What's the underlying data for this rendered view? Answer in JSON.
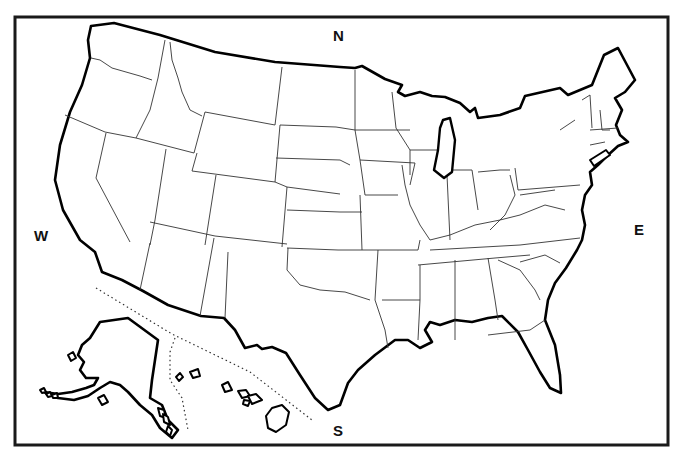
{
  "colors": {
    "background": "#ffffff",
    "coast": "#000000",
    "border": "#333333",
    "frame": "#1a1a1a"
  },
  "frame": {
    "x": 15,
    "y": 17,
    "width": 653,
    "height": 428
  },
  "compass": {
    "north": {
      "label": "N",
      "x": 333,
      "y": 28
    },
    "south": {
      "label": "S",
      "x": 333,
      "y": 423
    },
    "east": {
      "label": "E",
      "x": 634,
      "y": 222
    },
    "west": {
      "label": "W",
      "x": 34,
      "y": 228
    }
  },
  "regions": {
    "contiguous_us": "M91,26 L114,23 L160,35 L215,52 L275,62 L340,67 L355,68 L362,66 L385,79 L402,85 L398,92 L405,96 L420,92 L432,96 L445,97 L460,103 L470,112 L475,108 L478,118 L500,115 L520,108 L525,96 L560,88 L568,95 L592,85 L604,55 L618,48 L635,80 L625,92 L615,98 L622,110 L616,125 L620,135 L628,142 L618,146 L607,156 L598,165 L590,172 L592,185 L585,195 L582,210 L585,225 L582,240 L577,250 L566,268 L555,283 L548,300 L545,320 L555,345 L560,375 L561,393 L550,388 L540,372 L528,350 L518,332 L502,316 L488,318 L472,322 L455,320 L440,325 L430,322 L425,330 L432,342 L420,348 L408,340 L395,340 L375,355 L358,370 L348,383 L340,405 L328,410 L315,398 L300,375 L286,353 L272,347 L262,349 L257,345 L245,348 L235,330 L224,318 L201,316 L168,305 L143,291 L122,280 L102,272 L95,252 L80,240 L63,210 L55,180 L60,145 L70,112 L82,85 L90,58 L88,40 Z",
    "lake_michigan": "M443,120 L450,118 L455,140 L452,172 L444,178 L434,170 L438,150 L440,128 Z",
    "lake_michigan_north": "M420,115 L432,98 L445,100 L460,105 L470,112 L455,115 L440,112 L428,122 Z",
    "delaware_bay": "M580,185 L586,190 L584,200 L578,196 Z",
    "long_island": "M590,160 L606,150 L610,155 L594,166 Z",
    "alaska": "M100,322 L128,318 L158,340 L152,380 L150,398 L162,405 L168,420 L178,430 L172,438 L160,428 L152,415 L140,405 L128,392 L120,385 L110,382 L100,388 L88,396 L74,400 L58,398 L48,394 L44,392 L58,394 L72,392 L86,388 L94,385 L98,378 L86,378 L80,370 L84,362 L78,355 L82,345 L90,338 L95,330 Z",
    "hawaii_big": "M272,408 L282,405 L289,412 L286,425 L276,432 L268,428 L266,416 Z",
    "hawaii_islands": [
      "M176,377 L180,373 L183,377 L179,381 Z",
      "M190,372 L198,369 L200,376 L193,378 Z",
      "M222,385 L228,382 L232,390 L225,392 Z",
      "M238,391 L246,390 L250,396 L242,398 Z",
      "M248,396 L256,394 L262,400 L252,404 Z",
      "M244,400 L250,401 L248,406 L243,404 Z"
    ],
    "aleutians": [
      "M40,390 L44,388 L46,392 L42,393 Z",
      "M46,394 L50,392 L52,396 L48,397 Z",
      "M52,395 L57,393 L58,398 L53,398 Z",
      "M98,398 L104,395 L108,402 L102,405 Z",
      "M68,355 L73,352 L76,358 L71,361 Z"
    ],
    "alaska_panhandle_islands": [
      "M158,408 L164,410 L166,418 L160,416 Z",
      "M163,414 L168,417 L170,425 L164,422 Z",
      "M168,426 L172,430 L170,436 L166,432 Z"
    ]
  },
  "state_borders": [
    "M91,58 L100,60 L112,68 L140,76 L152,80",
    "M165,40 L158,78 L150,110 L136,138",
    "M170,42 L172,60 L178,78 L182,92 L190,110 L202,116",
    "M65,115 L105,132 L136,138 L194,153",
    "M106,133 L96,178 L122,227 L130,242",
    "M166,149 L155,220 L150,245",
    "M194,153 L205,112 L275,125 L282,67",
    "M280,125 L275,182 L192,171 L197,153",
    "M216,175 L205,245",
    "M150,222 L215,236 L287,244",
    "M287,187 L282,247",
    "M275,182 L287,187 L340,194",
    "M280,125 L336,127 L355,130",
    "M276,158 L340,160 L350,165",
    "M287,210 L340,212 L362,212",
    "M214,238 L200,316",
    "M150,243 L140,290",
    "M287,248 L338,250 L378,250",
    "M288,248 L287,270 L300,285 L320,290 L345,292 L370,300",
    "M225,318 L228,252",
    "M378,250 L375,300 L385,330 L388,348",
    "M378,250 L418,250 L420,240",
    "M382,300 L420,300",
    "M360,195 L362,250",
    "M355,70 L355,130 L360,160 L365,195",
    "M355,130 L410,130",
    "M360,160 L415,163 L410,185",
    "M365,195 L398,195",
    "M392,92 L396,128 L410,150 L410,175",
    "M410,150 L448,150",
    "M402,165 L405,185 L410,205 L420,225 L430,240",
    "M447,175 L450,240",
    "M448,170 L472,170 L478,210",
    "M478,172 L500,170 L510,170",
    "M510,175 L515,195 L505,215 L490,230",
    "M515,168 L518,190 L580,185",
    "M520,195 L555,190",
    "M430,240 L450,235 L475,225 L500,220 L520,215 L545,205 L565,210",
    "M430,250 L520,245 L580,238",
    "M418,265 L495,258 L530,255",
    "M420,265 L420,300 L418,340",
    "M455,260 L455,340",
    "M488,258 L495,300 L498,320",
    "M498,260 L520,270 L535,290 L540,300",
    "M520,262 L545,255 L560,263",
    "M560,130 L575,120",
    "M582,100 L590,95 L592,128",
    "M600,110 L602,130 L610,130",
    "M590,130 L618,128",
    "M590,145 L605,142",
    "M488,335 L530,330 L545,320"
  ],
  "dotted_lines": [
    "M96,288 L172,334 L250,372 L312,420",
    "M175,338 L170,352 L170,380 L182,398 L188,430"
  ]
}
